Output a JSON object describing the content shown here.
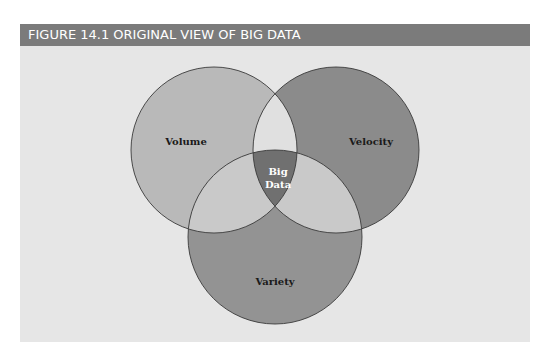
{
  "figure": {
    "title": "FIGURE 14.1  ORIGINAL VIEW OF BIG DATA"
  },
  "diagram": {
    "type": "venn",
    "sets": [
      {
        "id": "volume",
        "label": "Volume",
        "color": "#b9b9b9"
      },
      {
        "id": "velocity",
        "label": "Velocity",
        "color": "#8b8b8b"
      },
      {
        "id": "variety",
        "label": "Variety",
        "color": "#939393"
      }
    ],
    "intersections": {
      "volume_velocity": {
        "color": "#e0e0e0"
      },
      "volume_variety": {
        "color": "#c9c9c9"
      },
      "velocity_variety": {
        "color": "#c9c9c9"
      },
      "center": {
        "label_line1": "Big",
        "label_line2": "Data",
        "color": "#707070"
      }
    },
    "colors": {
      "header_bg": "#7b7b7b",
      "panel_bg": "#e6e6e6",
      "outline": "#3a3a3a"
    }
  }
}
